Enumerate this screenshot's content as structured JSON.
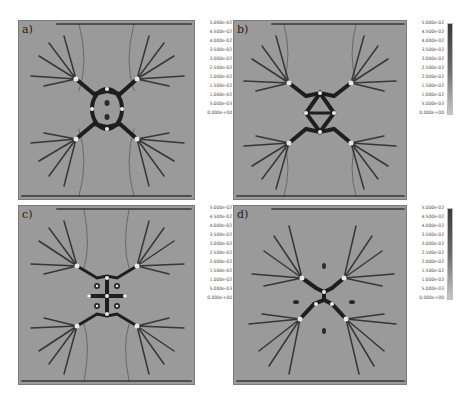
{
  "figure": {
    "panels": [
      {
        "id": "a",
        "label": "a)",
        "pattern": "ring"
      },
      {
        "id": "b",
        "label": "b)",
        "pattern": "ring-split"
      },
      {
        "id": "c",
        "label": "c)",
        "pattern": "cross"
      },
      {
        "id": "d",
        "label": "d)",
        "pattern": "x-shape"
      }
    ],
    "colorbar": {
      "labels": [
        "5.000e-02",
        "4.500e-02",
        "4.000e-02",
        "3.500e-02",
        "3.000e-02",
        "2.500e-02",
        "2.000e-02",
        "1.500e-02",
        "1.000e-02",
        "5.000e-03",
        "0.000e+00"
      ],
      "colors": {
        "high": "#3a3a3a",
        "mid": "#6a6a6a",
        "low": "#c8c8c8"
      }
    },
    "colors": {
      "background": "#9a9a9a",
      "crack": "#1e1e1e",
      "hole": "#e8e8e8"
    }
  }
}
